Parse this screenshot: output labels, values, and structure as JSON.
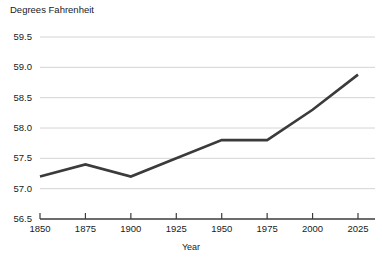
{
  "chart_data": {
    "type": "line",
    "title": "",
    "ylabel": "Degrees Fahrenheit",
    "xlabel": "Year",
    "x": [
      1850,
      1875,
      1900,
      1925,
      1950,
      1975,
      2000,
      2025
    ],
    "values": [
      57.2,
      57.4,
      57.2,
      57.5,
      57.8,
      57.8,
      58.3,
      58.88
    ],
    "series": [
      {
        "name": "Global average temperature",
        "values": [
          57.2,
          57.4,
          57.2,
          57.5,
          57.8,
          57.8,
          58.3,
          58.88
        ]
      }
    ],
    "xlim": [
      1850,
      2025
    ],
    "ylim": [
      56.5,
      59.5
    ],
    "yticks": [
      56.5,
      57.0,
      57.5,
      58.0,
      58.5,
      59.0,
      59.5
    ],
    "ytick_labels": [
      "56.5",
      "57.0",
      "57.5",
      "58.0",
      "58.5",
      "59.0",
      "59.5"
    ],
    "xticks": [
      1850,
      1875,
      1900,
      1925,
      1950,
      1975,
      2000,
      2025
    ],
    "xtick_labels": [
      "1850",
      "1875",
      "1900",
      "1925",
      "1950",
      "1975",
      "2000",
      "2025"
    ],
    "grid": "horizontal",
    "legend": "none",
    "line_color": "#3b3b3b",
    "grid_color": "#d4d4d4",
    "axis_color": "#3b3b3b",
    "background_color": "#ffffff"
  }
}
